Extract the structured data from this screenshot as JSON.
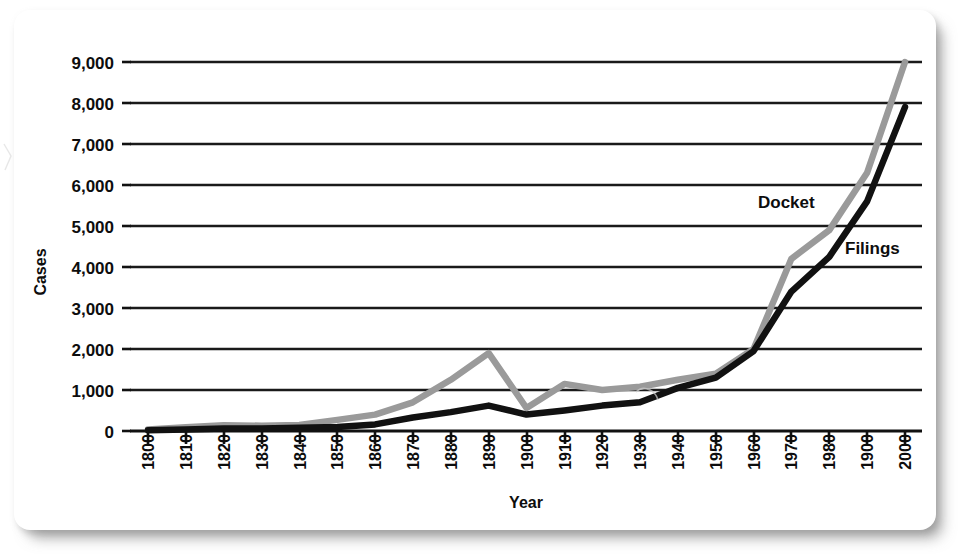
{
  "figure": {
    "y_axis_title": "Cases",
    "x_axis_title": "Year",
    "series_labels": {
      "docket": "Docket",
      "filings": "Filings"
    },
    "colors": {
      "docket_line": "#9a9a9a",
      "filings_line": "#111111",
      "gridline": "#1a1a1a",
      "page_background": "#ffffff"
    }
  },
  "chart_data": {
    "type": "line",
    "title": "",
    "subtitle": "",
    "xlabel": "Year",
    "ylabel": "Cases",
    "xlim": [
      1800,
      2000
    ],
    "ylim": [
      0,
      9000
    ],
    "grid": true,
    "grid_axis": "y",
    "legend_position": "inline-annotation",
    "x_tick_labels": [
      "1800",
      "1810",
      "1820",
      "1830",
      "1840",
      "1850",
      "1860",
      "1870",
      "1880",
      "1890",
      "1900",
      "1910",
      "1920",
      "1930",
      "1940",
      "1950",
      "1960",
      "1970",
      "1980",
      "1900",
      "2000"
    ],
    "y_tick_labels": [
      "0",
      "1,000",
      "2,000",
      "3,000",
      "4,000",
      "5,000",
      "6,000",
      "7,000",
      "8,000",
      "9,000"
    ],
    "y_tick_values": [
      0,
      1000,
      2000,
      3000,
      4000,
      5000,
      6000,
      7000,
      8000,
      9000
    ],
    "x": [
      1800,
      1810,
      1820,
      1830,
      1840,
      1850,
      1860,
      1870,
      1880,
      1890,
      1900,
      1910,
      1920,
      1930,
      1940,
      1950,
      1960,
      1970,
      1980,
      1990,
      2000
    ],
    "series": [
      {
        "name": "Docket",
        "color": "#9a9a9a",
        "values": [
          40,
          90,
          140,
          130,
          150,
          270,
          400,
          700,
          1250,
          1900,
          560,
          1150,
          1000,
          1080,
          1250,
          1400,
          2000,
          4200,
          4900,
          6300,
          9000
        ]
      },
      {
        "name": "Filings",
        "color": "#111111",
        "values": [
          20,
          40,
          60,
          60,
          80,
          100,
          160,
          330,
          460,
          620,
          400,
          500,
          620,
          700,
          1050,
          1300,
          1950,
          3400,
          4250,
          5600,
          7900
        ]
      }
    ],
    "annotations": [
      {
        "text": "Docket",
        "x": 1966,
        "y": 5550
      },
      {
        "text": "Filings",
        "x": 1979,
        "y": 4650
      }
    ]
  }
}
